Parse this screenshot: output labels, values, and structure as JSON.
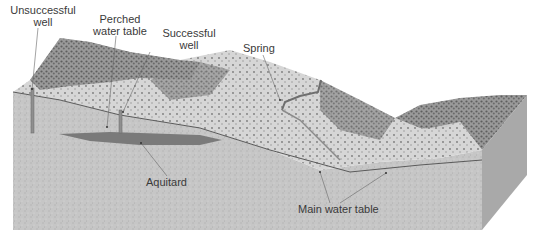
{
  "diagram": {
    "type": "groundwater block diagram",
    "labels": {
      "unsuccessful_well": [
        "Unsuccessful",
        "well"
      ],
      "perched_water_table": [
        "Perched",
        "water table"
      ],
      "successful_well": [
        "Successful",
        "well"
      ],
      "spring": "Spring",
      "aquitard": "Aquitard",
      "main_water_table": "Main water table"
    },
    "colors": {
      "background": "#ffffff",
      "ground_front": "#c9c9c9",
      "ground_side": "#a9a9a9",
      "surface_light": "#dcdcdc",
      "vegetation": "#6f6f6f",
      "aquitard": "#7a7a7a",
      "water_table_line": "#5a5a5a",
      "leader_line": "#666666",
      "text": "#3a3a3a"
    }
  }
}
